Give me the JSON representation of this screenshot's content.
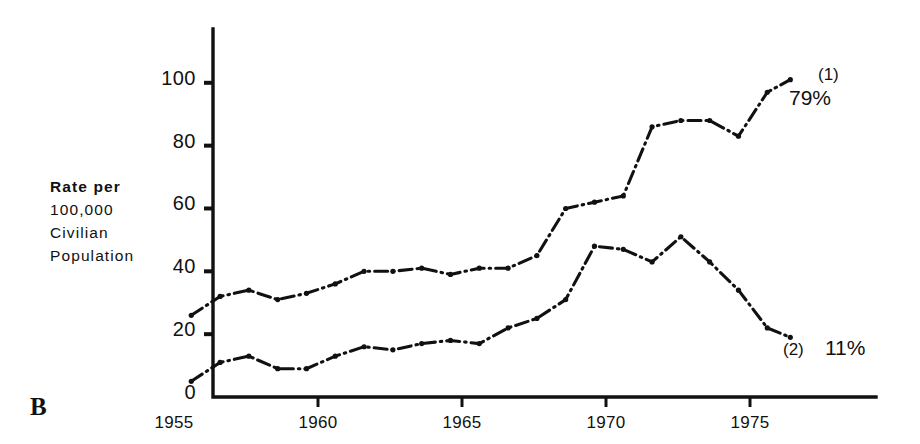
{
  "panel": {
    "label": "B"
  },
  "axis_label": {
    "lines": [
      "Rate per",
      "100,000",
      "Civilian",
      "Population"
    ]
  },
  "annotations": [
    {
      "tag": "(1)",
      "percent": "79%"
    },
    {
      "tag": "(2)",
      "percent": "11%"
    }
  ],
  "chart_data": {
    "type": "line",
    "title": "",
    "xlabel": "",
    "ylabel": "Rate per 100,000 Civilian Population",
    "xlim": [
      1955,
      1977
    ],
    "ylim": [
      0,
      110
    ],
    "yticks": [
      0,
      20,
      40,
      60,
      80,
      100
    ],
    "xticks": [
      1955,
      1960,
      1965,
      1970,
      1975
    ],
    "grid": false,
    "legend": "inline-annotations",
    "series": [
      {
        "name": "(1)",
        "label": "79%",
        "linestyle": "dash-dot",
        "x": [
          1955.6,
          1956.6,
          1957.6,
          1958.6,
          1959.6,
          1960.6,
          1961.6,
          1962.6,
          1963.6,
          1964.6,
          1965.6,
          1966.6,
          1967.6,
          1968.6,
          1969.6,
          1970.6,
          1971.6,
          1972.6,
          1973.6,
          1974.6,
          1975.6,
          1976.4
        ],
        "y": [
          26,
          32,
          34,
          31,
          33,
          36,
          40,
          40,
          41,
          39,
          41,
          41,
          45,
          60,
          62,
          64,
          86,
          88,
          88,
          83,
          97,
          101
        ]
      },
      {
        "name": "(2)",
        "label": "11%",
        "linestyle": "dash-dot",
        "x": [
          1955.6,
          1956.6,
          1957.6,
          1958.6,
          1959.6,
          1960.6,
          1961.6,
          1962.6,
          1963.6,
          1964.6,
          1965.6,
          1966.6,
          1967.6,
          1968.6,
          1969.6,
          1970.6,
          1971.6,
          1972.6,
          1973.6,
          1974.6,
          1975.6,
          1976.4
        ],
        "y": [
          5,
          11,
          13,
          9,
          9,
          13,
          16,
          15,
          17,
          18,
          17,
          22,
          25,
          31,
          48,
          47,
          43,
          51,
          43,
          34,
          22,
          19
        ]
      }
    ]
  }
}
